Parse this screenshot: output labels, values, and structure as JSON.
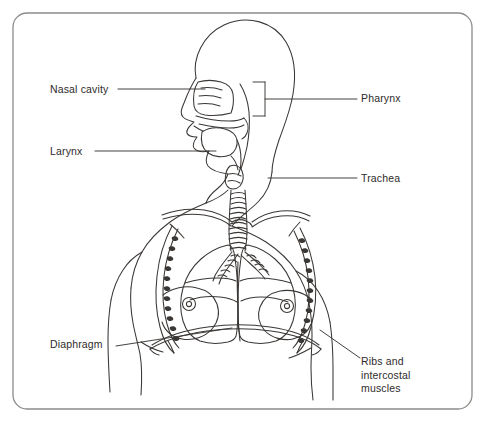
{
  "figure": {
    "name": "human-respiratory-system-diagram",
    "type": "anatomical-line-drawing",
    "background_color": "#ffffff",
    "line_color": "#3a3735",
    "border_color": "#8f8c89",
    "text_color": "#2e2b2a"
  },
  "labels": {
    "nasal_cavity": "Nasal cavity",
    "larynx": "Larynx",
    "pharynx": "Pharynx",
    "trachea": "Trachea",
    "diaphragm": "Diaphragm",
    "ribs_line1": "Ribs and",
    "ribs_line2": "intercostal",
    "ribs_line3": "muscles"
  },
  "caption": {
    "partial_text": ""
  }
}
